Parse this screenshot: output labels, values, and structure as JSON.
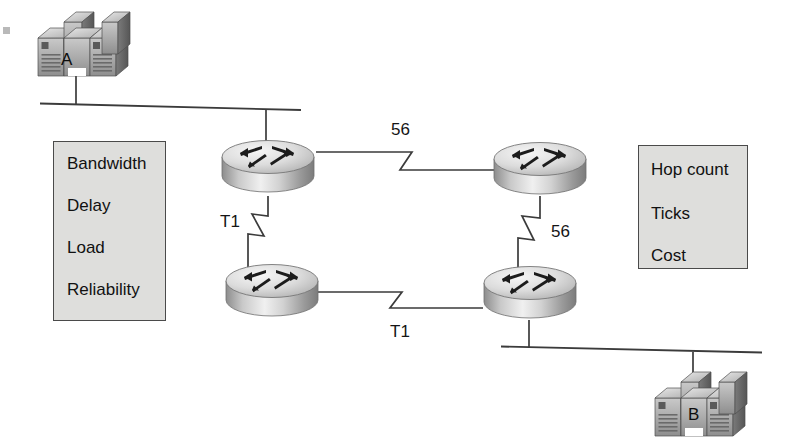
{
  "diagram": {
    "background_color": "#ffffff"
  },
  "metric_boxes": [
    {
      "name": "igrp-metrics-box",
      "fill_color": "#dededc",
      "border_color": "#4a4a4a",
      "items": [
        "Bandwidth",
        "Delay",
        "Load",
        "Reliability"
      ]
    },
    {
      "name": "distance-vector-metrics-box",
      "fill_color": "#dededc",
      "border_color": "#4a4a4a",
      "items": [
        "Hop count",
        "Ticks",
        "Cost"
      ]
    }
  ],
  "hosts": [
    {
      "name": "host-a",
      "label": "A"
    },
    {
      "name": "host-b",
      "label": "B"
    }
  ],
  "routers": [
    {
      "name": "router-top-left"
    },
    {
      "name": "router-top-right"
    },
    {
      "name": "router-bottom-left"
    },
    {
      "name": "router-bottom-right"
    }
  ],
  "links": [
    {
      "name": "serial-link-top",
      "label": "56",
      "type": "serial"
    },
    {
      "name": "serial-link-left",
      "label": "T1",
      "type": "serial"
    },
    {
      "name": "serial-link-right",
      "label": "56",
      "type": "serial"
    },
    {
      "name": "serial-link-bottom",
      "label": "T1",
      "type": "serial"
    },
    {
      "name": "ethernet-segment-top",
      "label": "",
      "type": "ethernet"
    },
    {
      "name": "ethernet-segment-bottom",
      "label": "",
      "type": "ethernet"
    }
  ],
  "colors": {
    "line": "#3b3b3b",
    "box_fill": "#dededc",
    "box_border": "#4a4a4a",
    "text": "#111111",
    "icon_light": "#f2f2f2",
    "icon_mid": "#b8b8b8",
    "icon_dark": "#6e6e6e"
  }
}
